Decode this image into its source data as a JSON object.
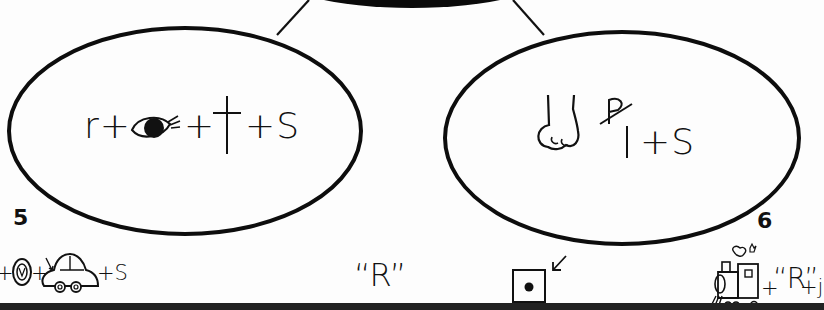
{
  "worksheet": {
    "center_bubble": {
      "lines": 2
    },
    "left_oval": {
      "rebus": {
        "prefix": "r+",
        "eye_symbol": "eye-icon",
        "middle": "+",
        "cross_symbol": "†",
        "suffix": "+S"
      }
    },
    "right_oval": {
      "rebus": {
        "nose_symbol": "nose-icon",
        "crossed_letter": "P",
        "letter": "l",
        "suffix": "+S"
      }
    },
    "items": [
      {
        "number": "5",
        "clue_prefix": "+",
        "clue_middle": "+",
        "clue_suffix": "+S",
        "icons": [
          "ring-icon",
          "car-icon"
        ]
      },
      {
        "clue": "“R”"
      },
      {
        "clue_icon": "dotted-box-icon",
        "arrow": "↙"
      },
      {
        "number": "6",
        "clue_icon": "train-icon",
        "clue_suffix_plus": "+",
        "clue_quote": "“R”",
        "clue_tail": "+j"
      }
    ]
  }
}
